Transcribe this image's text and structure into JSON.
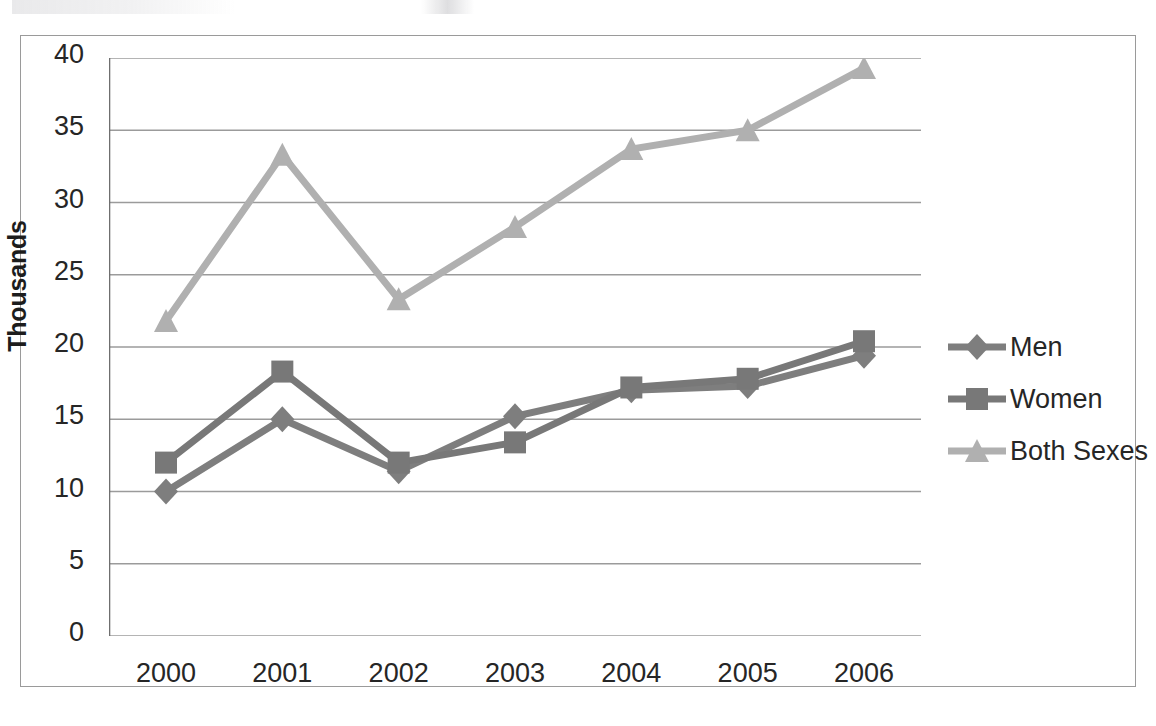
{
  "chart_data": {
    "type": "line",
    "title": "",
    "xlabel": "",
    "ylabel": "Thousands",
    "x": [
      "2000",
      "2001",
      "2002",
      "2003",
      "2004",
      "2005",
      "2006"
    ],
    "categories": [
      "2000",
      "2001",
      "2002",
      "2003",
      "2004",
      "2005",
      "2006"
    ],
    "series": [
      {
        "name": "Men",
        "marker": "diamond",
        "color": "#7e7e7e",
        "values": [
          10.0,
          15.0,
          11.4,
          15.2,
          17.0,
          17.3,
          19.4
        ]
      },
      {
        "name": "Women",
        "marker": "square",
        "color": "#787878",
        "values": [
          12.0,
          18.3,
          12.0,
          13.4,
          17.2,
          17.8,
          20.4
        ]
      },
      {
        "name": "Both Sexes",
        "marker": "triangle",
        "color": "#b0b0b0",
        "values": [
          21.8,
          33.3,
          23.3,
          28.3,
          33.7,
          35.0,
          39.3
        ]
      }
    ],
    "ylim": [
      0,
      40
    ],
    "yticks": [
      0,
      5,
      10,
      15,
      20,
      25,
      30,
      35,
      40
    ],
    "ytick_labels": [
      "0",
      "5",
      "10",
      "15",
      "20",
      "25",
      "30",
      "35",
      "40"
    ],
    "grid": "horizontal",
    "legend_position": "right"
  },
  "legend": {
    "items": [
      {
        "label": "Men"
      },
      {
        "label": "Women"
      },
      {
        "label": "Both Sexes"
      }
    ]
  },
  "colors": {
    "men": "#7e7e7e",
    "women": "#787878",
    "both_sexes": "#b0b0b0",
    "gridline": "#9b9b9b",
    "axis": "#6f6f6f",
    "frame": "#9a9a9a",
    "text": "#262626"
  }
}
